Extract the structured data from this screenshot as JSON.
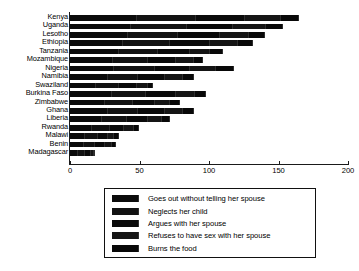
{
  "chart_data": {
    "type": "bar",
    "orientation": "horizontal",
    "stacked": true,
    "title": "",
    "subtitle": "",
    "xlabel": "",
    "ylabel": "",
    "xlim": [
      0,
      200
    ],
    "xticks": [
      0,
      50,
      100,
      150,
      200
    ],
    "xticklabels": [
      "0",
      "50",
      "100",
      "150",
      "200"
    ],
    "grid": false,
    "legend_position": "bottom-center",
    "categories": [
      "Kenya",
      "Uganda",
      "Lesotho",
      "Ethiopia",
      "Tanzania",
      "Mozambique",
      "Nigeria",
      "Namibia",
      "Swaziland",
      "Burkina Faso",
      "Zimbabwe",
      "Ghana",
      "Liberia",
      "Rwanda",
      "Malawi",
      "Benin",
      "Madagascar"
    ],
    "series": [
      {
        "name": "Goes out without telling her spouse",
        "values": [
          48,
          44,
          42,
          38,
          35,
          31,
          32,
          27,
          19,
          30,
          25,
          27,
          23,
          16,
          11,
          10,
          6
        ]
      },
      {
        "name": "Neglects her child",
        "values": [
          43,
          40,
          36,
          34,
          28,
          25,
          29,
          22,
          16,
          25,
          20,
          22,
          18,
          13,
          9,
          8,
          5
        ]
      },
      {
        "name": "Argues with her spouse",
        "values": [
          35,
          33,
          30,
          29,
          23,
          20,
          25,
          19,
          13,
          21,
          16,
          19,
          15,
          10,
          7,
          7,
          4
        ]
      },
      {
        "name": "Refuses to have sex with her spouse",
        "values": [
          26,
          24,
          21,
          20,
          15,
          13,
          19,
          13,
          8,
          14,
          11,
          13,
          10,
          7,
          5,
          5,
          2
        ]
      },
      {
        "name": "Burns the food",
        "values": [
          13,
          12,
          11,
          11,
          9,
          7,
          13,
          8,
          4,
          8,
          7,
          8,
          6,
          4,
          3,
          3,
          1
        ]
      }
    ],
    "totals": [
      165,
      153,
      140,
      132,
      110,
      96,
      118,
      89,
      60,
      98,
      79,
      89,
      72,
      50,
      35,
      33,
      18
    ]
  },
  "legend": {
    "items": [
      {
        "label": "Goes out without telling her spouse",
        "swatch": "legend-swatch-1"
      },
      {
        "label": "Neglects her child",
        "swatch": "legend-swatch-2"
      },
      {
        "label": "Argues with her spouse",
        "swatch": "legend-swatch-3"
      },
      {
        "label": "Refuses to have sex with her spouse",
        "swatch": "legend-swatch-4"
      },
      {
        "label": "Burns the food",
        "swatch": "legend-swatch-5"
      }
    ]
  }
}
